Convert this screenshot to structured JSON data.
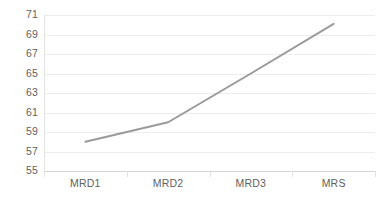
{
  "chart_data": {
    "type": "line",
    "title": "",
    "subtitle": "",
    "xlabel": "",
    "ylabel": "",
    "categories": [
      "MRD1",
      "MRD2",
      "MRD3",
      "MRS"
    ],
    "series": [
      {
        "name": "Series 1",
        "values": [
          58.0,
          60.0,
          65.0,
          70.1
        ],
        "color": "#9a9a9a",
        "line_width": 2,
        "markers": false
      }
    ],
    "ylim": [
      55,
      71
    ],
    "ytick_step": 2,
    "yticks": [
      55,
      57,
      59,
      61,
      63,
      65,
      67,
      69,
      71
    ],
    "ytick_labels": [
      "55",
      "57",
      "59",
      "61",
      "63",
      "65",
      "67",
      "69",
      "71"
    ],
    "grid": {
      "horizontal": true,
      "vertical": false,
      "color": "#eceded"
    },
    "legend": {
      "visible": false,
      "position": "none",
      "entries": []
    },
    "axis": {
      "baseline_color": "#d2d4d5",
      "tick_color": "#e0e1e2",
      "label_color": "#5f5f5f"
    },
    "annotations": [],
    "background": "#ffffff"
  }
}
